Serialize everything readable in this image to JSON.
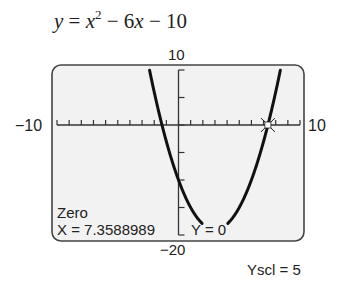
{
  "equation": {
    "y": "y",
    "eq": " = ",
    "x": "x",
    "exp": "2",
    "rest": " − 6",
    "x2": "x",
    "tail": " − 10"
  },
  "window": {
    "xmin_label": "−10",
    "xmax_label": "10",
    "ymax_label": "10",
    "ymin_label": "−20",
    "xmin": -10,
    "xmax": 10,
    "ymin": -20,
    "ymax": 10,
    "xscl": 1,
    "yscl": 5
  },
  "readout": {
    "mode": "Zero",
    "x_text": "X = 7.3588989",
    "y_text": "Y = 0"
  },
  "scale_note": "Yscl = 5",
  "colors": {
    "screen_bg": "#f2f2f2",
    "frame": "#444444",
    "curve": "#111111",
    "axis": "#333333"
  },
  "chart_data": {
    "type": "line",
    "function": "x^2 - 6x - 10",
    "xlim": [
      -10,
      10
    ],
    "ylim": [
      -20,
      10
    ],
    "xscl": 1,
    "yscl": 5,
    "zero_point": {
      "x": 7.3588989,
      "y": 0
    },
    "xlabel": "",
    "ylabel": "",
    "grid": false
  }
}
